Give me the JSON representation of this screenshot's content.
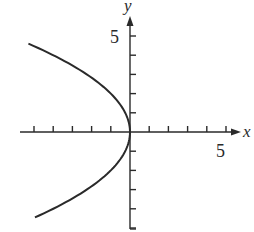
{
  "chart_data": {
    "type": "line",
    "title": "",
    "xlabel": "x",
    "ylabel": "y",
    "xlim": [
      -5,
      5.8
    ],
    "ylim": [
      -5,
      6
    ],
    "grid": false,
    "legend": null,
    "x_ticks": [
      -5,
      -4,
      -3,
      -2,
      -1,
      1,
      2,
      3,
      4,
      5
    ],
    "y_ticks": [
      -5,
      -4,
      -3,
      -2,
      -1,
      1,
      2,
      3,
      4,
      5
    ],
    "x_tick_labels": [
      {
        "value": 5,
        "label": "5"
      }
    ],
    "y_tick_labels": [
      {
        "value": 5,
        "label": "5"
      }
    ],
    "series": [
      {
        "name": "x = -y^2/4",
        "equation": "x = -y^2/4",
        "y_range": [
          -4.45,
          4.6
        ],
        "points": [
          {
            "x": -5.29,
            "y": 4.6
          },
          {
            "x": -4.0,
            "y": 4.0
          },
          {
            "x": -2.25,
            "y": 3.0
          },
          {
            "x": -1.0,
            "y": 2.0
          },
          {
            "x": -0.25,
            "y": 1.0
          },
          {
            "x": 0.0,
            "y": 0.0
          },
          {
            "x": -0.25,
            "y": -1.0
          },
          {
            "x": -1.0,
            "y": -2.0
          },
          {
            "x": -2.25,
            "y": -3.0
          },
          {
            "x": -4.0,
            "y": -4.0
          },
          {
            "x": -4.95,
            "y": -4.45
          }
        ]
      }
    ],
    "colors": {
      "curve": "#2a2a2a",
      "axes": "#2a2a2a",
      "background": "#ffffff"
    }
  },
  "labels": {
    "x_axis": "x",
    "y_axis": "y",
    "x_tick_5": "5",
    "y_tick_5": "5"
  },
  "layout": {
    "origin_px": [
      130,
      132
    ],
    "unit_px": 19.2
  }
}
